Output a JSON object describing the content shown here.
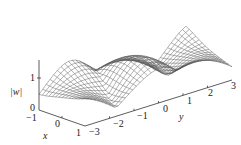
{
  "chart_data": {
    "type": "surface-wireframe",
    "title": "",
    "zlabel": "|w|",
    "xlabel": "x",
    "ylabel": "y",
    "x_range": [
      -1,
      1
    ],
    "y_range": [
      -3,
      3
    ],
    "z_range": [
      0,
      1.6
    ],
    "x_ticks": [
      "-1",
      "0",
      "1"
    ],
    "y_ticks": [
      "-3",
      "-2",
      "-1",
      "0",
      "1",
      "2",
      "3"
    ],
    "z_ticks": [
      "0",
      "1"
    ],
    "grid_x_lines": 14,
    "grid_y_lines": 40,
    "surface_description": "Periodic along y with peaks near y≈-2.5, 0, 2.5 at x=1 side and valleys between; wireframe mesh, no fill",
    "line_color": "#555555",
    "axis_color": "#333333"
  },
  "labels": {
    "z_axis": "|w|",
    "x_axis": "x",
    "y_axis": "y",
    "z_tick_0": "0",
    "z_tick_1": "1",
    "x_tick_m1": "−1",
    "x_tick_0": "0",
    "x_tick_1": "1",
    "y_tick_m3": "−3",
    "y_tick_m2": "−2",
    "y_tick_m1": "−1",
    "y_tick_0": "0",
    "y_tick_1": "1",
    "y_tick_2": "2",
    "y_tick_3": "3"
  }
}
